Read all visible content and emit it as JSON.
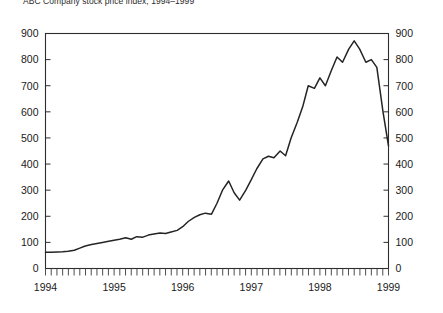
{
  "chart_data": {
    "type": "line",
    "title": "ABC Company stock price index, 1994–1999",
    "xlabel": "",
    "ylabel": "",
    "ylim": [
      0,
      900
    ],
    "xlim": [
      1994,
      1999
    ],
    "grid": false,
    "legend": "none",
    "y_ticks": [
      0,
      100,
      200,
      300,
      400,
      500,
      600,
      700,
      800,
      900
    ],
    "y_ticks_left": [
      "0",
      "100",
      "200",
      "300",
      "400",
      "500",
      "600",
      "700",
      "800",
      "900"
    ],
    "y_ticks_right": [
      "0",
      "100",
      "200",
      "300",
      "400",
      "500",
      "600",
      "700",
      "800",
      "900"
    ],
    "x_tick_labels": [
      "1994",
      "1995",
      "1996",
      "1997",
      "1998",
      "1999"
    ],
    "x_minor_ticks_per_year": 12,
    "dual_y_axis": true,
    "series": [
      {
        "name": "Stock price index",
        "color": "#242424",
        "x": [
          1994.0,
          1994.08,
          1994.17,
          1994.25,
          1994.33,
          1994.42,
          1994.5,
          1994.58,
          1994.67,
          1994.75,
          1994.83,
          1994.92,
          1995.0,
          1995.08,
          1995.17,
          1995.25,
          1995.33,
          1995.42,
          1995.5,
          1995.58,
          1995.67,
          1995.75,
          1995.83,
          1995.92,
          1996.0,
          1996.08,
          1996.17,
          1996.25,
          1996.33,
          1996.42,
          1996.5,
          1996.58,
          1996.67,
          1996.75,
          1996.83,
          1996.92,
          1997.0,
          1997.08,
          1997.17,
          1997.25,
          1997.33,
          1997.42,
          1997.5,
          1997.58,
          1997.67,
          1997.75,
          1997.83,
          1997.92,
          1998.0,
          1998.08,
          1998.17,
          1998.25,
          1998.33,
          1998.42,
          1998.5,
          1998.58,
          1998.67,
          1998.75,
          1998.83,
          1998.92,
          1999.0
        ],
        "values": [
          62,
          62,
          63,
          64,
          66,
          70,
          78,
          86,
          92,
          96,
          100,
          104,
          108,
          112,
          118,
          112,
          122,
          120,
          128,
          132,
          136,
          134,
          140,
          146,
          160,
          180,
          196,
          206,
          212,
          208,
          250,
          300,
          335,
          290,
          262,
          300,
          340,
          382,
          420,
          430,
          424,
          450,
          432,
          500,
          560,
          620,
          700,
          690,
          730,
          700,
          760,
          810,
          790,
          840,
          872,
          840,
          790,
          800,
          770,
          600,
          470
        ]
      }
    ],
    "annotations": []
  }
}
